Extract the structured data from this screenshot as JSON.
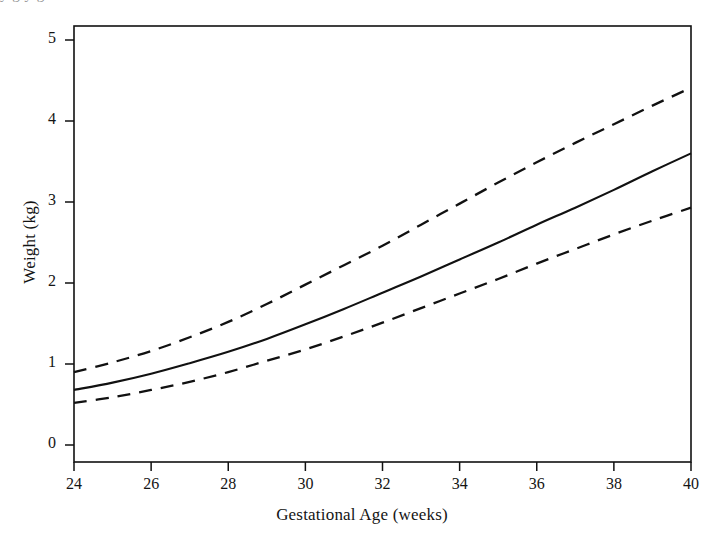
{
  "figure": {
    "bleed_text_top": "y  g   y   g",
    "background_color": "#ffffff",
    "line_color": "#111111"
  },
  "chart_data": {
    "type": "line",
    "title": "",
    "xlabel": "Gestational Age (weeks)",
    "ylabel": "Weight (kg)",
    "xlim": [
      24,
      40
    ],
    "ylim": [
      0,
      5
    ],
    "xticks": [
      24,
      26,
      28,
      30,
      32,
      34,
      36,
      38,
      40
    ],
    "yticks": [
      0,
      1,
      2,
      3,
      4,
      5
    ],
    "xtick_labels": [
      "24",
      "26",
      "28",
      "30",
      "32",
      "34",
      "36",
      "38",
      "40"
    ],
    "ytick_labels": [
      "0",
      "1",
      "2",
      "3",
      "4",
      "5"
    ],
    "grid": false,
    "legend": null,
    "x": [
      24,
      25,
      26,
      27,
      28,
      29,
      30,
      31,
      32,
      33,
      34,
      35,
      36,
      37,
      38,
      39,
      40
    ],
    "series": [
      {
        "name": "Upper limit (+2 SD)",
        "style": "dashed",
        "color": "#111111",
        "values": [
          0.9,
          1.02,
          1.16,
          1.33,
          1.52,
          1.74,
          1.98,
          2.22,
          2.46,
          2.72,
          2.98,
          3.24,
          3.49,
          3.73,
          3.96,
          4.19,
          4.41
        ]
      },
      {
        "name": "Mean weight",
        "style": "solid",
        "color": "#111111",
        "values": [
          0.68,
          0.77,
          0.88,
          1.01,
          1.15,
          1.31,
          1.49,
          1.68,
          1.88,
          2.08,
          2.29,
          2.5,
          2.72,
          2.93,
          3.15,
          3.38,
          3.6
        ]
      },
      {
        "name": "Lower limit (-2 SD)",
        "style": "dashed",
        "color": "#111111",
        "values": [
          0.52,
          0.59,
          0.68,
          0.78,
          0.9,
          1.04,
          1.18,
          1.34,
          1.51,
          1.69,
          1.87,
          2.05,
          2.24,
          2.42,
          2.6,
          2.77,
          2.93
        ]
      }
    ]
  }
}
